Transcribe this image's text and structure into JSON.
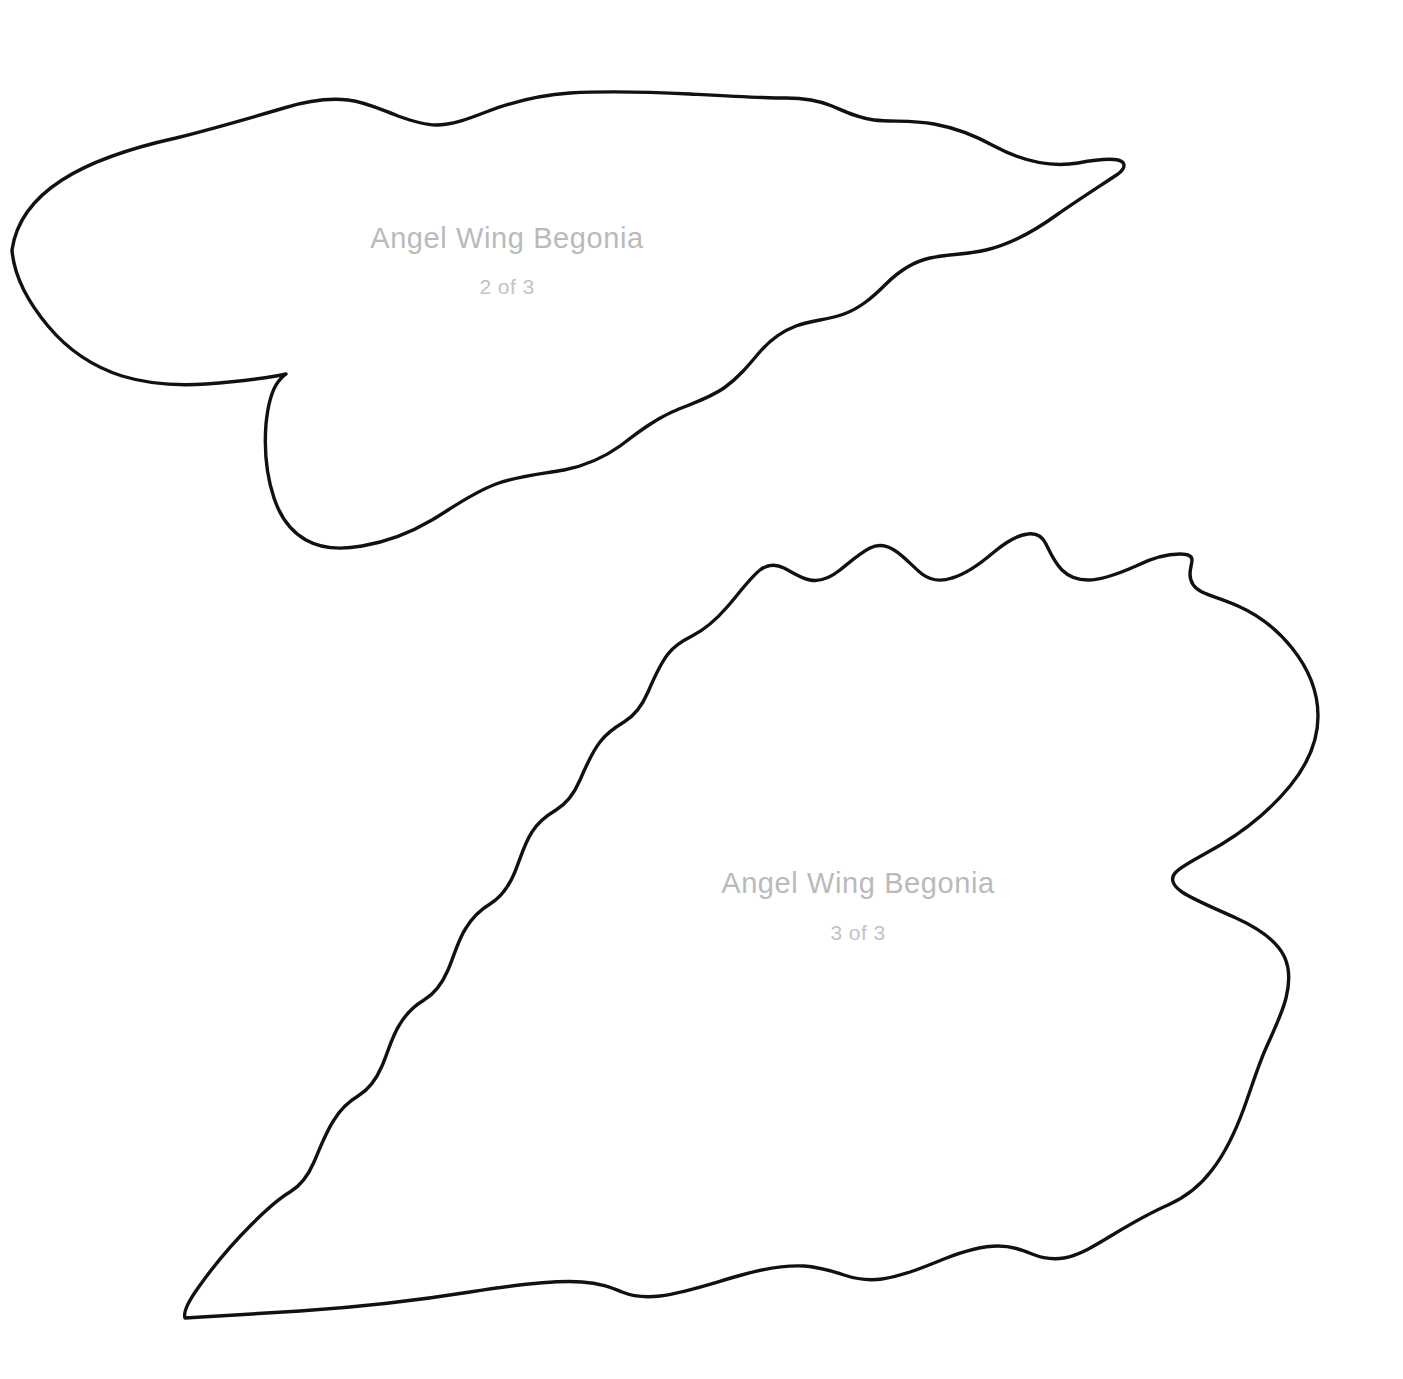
{
  "page": {
    "background_color": "#ffffff",
    "stroke_color": "#111111",
    "label_color": "#b9babc",
    "sublabel_color": "#c2c3c5",
    "width": 1403,
    "height": 1379
  },
  "templates": [
    {
      "id": "leaf-template-2",
      "title": "Angel Wing Begonia",
      "subtitle": "2 of 3",
      "title_x": 507,
      "title_y": 248,
      "subtitle_x": 507,
      "subtitle_y": 294,
      "outline_path": "M 12 250 C 16 222 34 198 62 180 C 96 158 140 146 176 138 C 216 128 250 118 284 108 C 310 100 330 98 348 100 C 366 102 382 110 398 116 C 412 121 424 125 436 125 C 452 125 468 119 486 112 C 512 102 540 95 570 93 C 606 91 650 92 690 94 C 726 96 760 98 786 98 C 806 98 820 101 832 106 C 846 112 858 118 874 120 C 892 122 912 120 934 124 C 956 128 976 136 994 146 C 1020 160 1048 168 1078 163 C 1094 160 1108 158 1118 160 C 1126 162 1126 168 1118 174 C 1100 186 1078 200 1058 214 C 1036 230 1012 244 986 250 C 964 255 948 254 930 258 C 912 262 898 272 886 284 C 872 298 860 308 844 314 C 828 320 812 320 796 326 C 780 332 768 342 758 354 C 748 366 738 378 724 388 C 708 399 690 404 672 412 C 652 421 636 434 620 446 C 602 459 584 466 564 470 C 542 474 518 476 496 484 C 472 493 452 508 432 520 C 410 533 386 542 362 546 C 340 550 320 548 306 540 C 290 531 280 516 274 498 C 266 474 264 450 266 424 C 268 404 272 390 278 382 C 282 377 284 375 286 374 C 286 374 282 375 276 376 C 258 379 234 382 206 384 C 176 386 148 384 122 376 C 94 367 68 350 48 326 C 28 302 14 276 12 250 Z"
    },
    {
      "id": "leaf-template-3",
      "title": "Angel Wing Begonia",
      "subtitle": "3 of 3",
      "title_x": 858,
      "title_y": 893,
      "subtitle_x": 858,
      "subtitle_y": 940,
      "outline_path": "M 185 1318 C 214 1316 256 1314 300 1311 C 360 1307 420 1300 470 1292 C 520 1284 556 1280 582 1282 C 600 1283 612 1288 622 1292 C 632 1296 644 1298 660 1296 C 684 1293 710 1284 738 1276 C 762 1269 784 1265 804 1266 C 820 1267 832 1271 844 1275 C 856 1279 868 1281 882 1279 C 902 1276 922 1268 944 1259 C 964 1251 982 1246 998 1246 C 1012 1246 1022 1250 1032 1254 C 1042 1258 1052 1260 1064 1258 C 1080 1255 1096 1245 1114 1234 C 1134 1222 1152 1212 1168 1205 C 1186 1197 1200 1186 1212 1170 C 1226 1152 1236 1130 1244 1108 C 1252 1086 1258 1066 1266 1048 C 1274 1030 1282 1014 1286 998 C 1290 982 1290 968 1284 956 C 1276 940 1258 928 1236 918 C 1214 908 1194 900 1182 892 C 1172 885 1170 878 1176 872 C 1184 864 1202 856 1222 844 C 1248 828 1272 808 1290 786 C 1308 764 1318 740 1318 716 C 1318 692 1308 668 1292 648 C 1276 628 1256 614 1238 606 C 1222 599 1210 596 1202 592 C 1194 588 1190 582 1190 574 C 1190 568 1192 564 1192 560 C 1192 556 1188 554 1180 554 C 1168 554 1152 558 1136 566 C 1118 574 1102 580 1088 580 C 1076 580 1068 576 1062 570 C 1054 562 1050 552 1046 544 C 1042 536 1036 533 1028 534 C 1018 535 1006 542 994 552 C 980 564 966 574 952 578 C 940 582 930 580 922 574 C 912 566 904 556 894 550 C 886 545 878 544 870 548 C 860 553 850 562 840 570 C 830 578 820 582 810 580 C 800 578 792 572 784 568 C 776 564 768 564 760 570 C 750 578 740 592 728 606 C 716 620 704 630 692 636 C 682 641 674 646 668 654 C 660 664 654 678 648 692 C 642 706 634 716 624 722 C 614 728 606 734 600 742 C 592 752 586 766 580 780 C 574 794 566 804 556 810 C 546 816 538 822 532 832 C 524 844 520 860 514 874 C 508 888 500 898 490 904 C 480 910 472 918 466 928 C 458 940 454 956 448 970 C 442 984 434 994 424 1000 C 414 1006 406 1014 400 1024 C 392 1036 388 1052 382 1066 C 376 1080 368 1090 358 1096 C 348 1102 340 1110 334 1120 C 326 1132 320 1148 314 1162 C 308 1176 300 1186 290 1192 C 278 1199 266 1210 252 1224 C 232 1244 212 1268 198 1288 C 188 1302 183 1312 185 1318 Z"
    }
  ]
}
